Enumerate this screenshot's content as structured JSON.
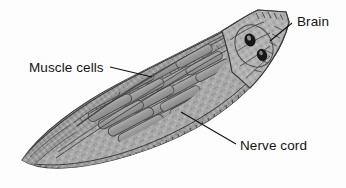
{
  "figure": {
    "kind": "biological-diagram",
    "background_color": "#fdfdfd",
    "body_fill_color": "#a8a8a8",
    "body_outline_color": "#3b3b3b",
    "muscle_band_color": "#9a9a9a",
    "muscle_band_outline_color": "#4a4a4a",
    "eye_spot_color": "#171717",
    "leader_line_color": "#111111",
    "head_fill_color": "#b4b4b4"
  },
  "labels": [
    {
      "id": "brain",
      "text": "Brain",
      "name": "label-brain",
      "leader": {
        "x1": 292,
        "y1": 23,
        "x2": 270,
        "y2": 41
      }
    },
    {
      "id": "muscle_cells",
      "text": "Muscle cells",
      "name": "label-muscle-cells",
      "leader": {
        "x1": 110,
        "y1": 67,
        "x2": 152,
        "y2": 77
      }
    },
    {
      "id": "nerve_cord",
      "text": "Nerve cord",
      "name": "label-nerve-cord",
      "leader": {
        "x1": 236,
        "y1": 144,
        "x2": 181,
        "y2": 112
      }
    }
  ],
  "anatomy": {
    "eye_spots": [
      {
        "cx": 250,
        "cy": 40,
        "rx": 5.0,
        "ry": 6.2,
        "rot": -18
      },
      {
        "cx": 262,
        "cy": 55,
        "rx": 4.6,
        "ry": 5.8,
        "rot": -18
      }
    ],
    "muscle_band_rows": 3,
    "muscle_bands_per_row": 16,
    "segment_tick_count": 74
  }
}
